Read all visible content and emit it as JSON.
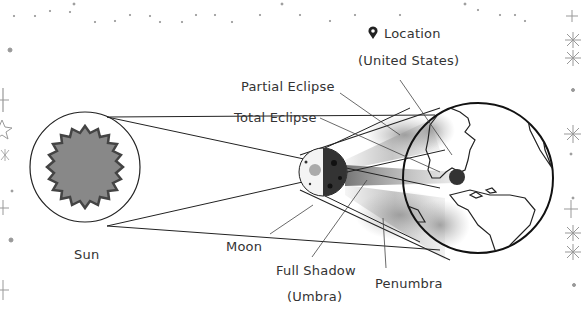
{
  "diagram": {
    "bodies": {
      "sun": {
        "label": "Sun",
        "color": "#8a8a8a"
      },
      "moon": {
        "label": "Moon"
      },
      "earth": {
        "label": "Earth"
      }
    },
    "labels": {
      "location_line1": "Location",
      "location_line2": "(United States)",
      "partial_eclipse": "Partial Eclipse",
      "total_eclipse": "Total Eclipse",
      "sun": "Sun",
      "moon": "Moon",
      "full_shadow_line1": "Full Shadow",
      "full_shadow_line2": "(Umbra)",
      "penumbra": "Penumbra"
    },
    "icons": {
      "location": "map-pin-icon"
    }
  }
}
